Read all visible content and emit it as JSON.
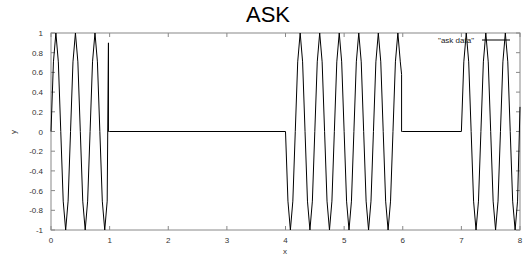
{
  "chart_data": {
    "type": "line",
    "title": "ASK",
    "xlabel": "x",
    "ylabel": "y",
    "xlim": [
      0,
      8
    ],
    "ylim": [
      -1,
      1
    ],
    "xticks": [
      0,
      1,
      2,
      3,
      4,
      5,
      6,
      7,
      8
    ],
    "xtick_labels": [
      "0",
      "1",
      "2",
      "3",
      "4",
      "5",
      "6",
      "7",
      "8"
    ],
    "yticks": [
      -1,
      -0.8,
      -0.6,
      -0.4,
      -0.2,
      0,
      0.2,
      0.4,
      0.6,
      0.8,
      1
    ],
    "ytick_labels": [
      "-1",
      "-0.8",
      "-0.6",
      "-0.4",
      "-0.2",
      "0",
      "0.2",
      "0.4",
      "0.6",
      "0.8",
      "1"
    ],
    "grid": false,
    "legend_position": "top-right",
    "series": [
      {
        "name": "\"ask data\"",
        "color": "#000000",
        "description": "Amplitude-shift keyed carrier, 3 cycles per unit; carrier present on [0,1], [4,6], [7,8]; zero elsewhere",
        "carrier_cycles_per_unit": 3,
        "bits": [
          1,
          0,
          0,
          0,
          1,
          1,
          0,
          1
        ],
        "segments": [
          {
            "start": 0,
            "end": 1,
            "on": true,
            "phase": 0,
            "end_spike": 0.9
          },
          {
            "start": 1,
            "end": 4,
            "on": false,
            "value": 0
          },
          {
            "start": 4,
            "end": 6,
            "on": true,
            "phase": 3.14159,
            "end_spike": 0.58
          },
          {
            "start": 6,
            "end": 7,
            "on": false,
            "value": 0
          },
          {
            "start": 7,
            "end": 8,
            "on": true,
            "phase": 0,
            "end_value": 0.25
          }
        ]
      }
    ]
  },
  "legend": {
    "label": "\"ask data\""
  },
  "colors": {
    "line": "#000000",
    "frame": "#888888",
    "background": "#ffffff"
  }
}
